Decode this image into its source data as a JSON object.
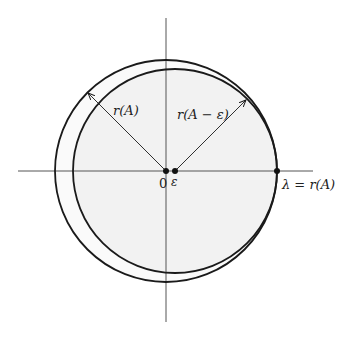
{
  "diagram": {
    "title": "",
    "labels": {
      "outer_radius": "r(A)",
      "inner_radius": "r(A − ε)",
      "origin": "0",
      "epsilon": "ε",
      "lambda": "λ = r(A)"
    },
    "elements": {
      "outer_circle": {
        "center": [
          166,
          171
        ],
        "radius": 111,
        "description": "circle of radius r(A) centered at 0"
      },
      "inner_circle": {
        "center": [
          175,
          171
        ],
        "radius": 102,
        "description": "circle of radius r(A−ε) centered at ε, shaded"
      },
      "points": [
        "0",
        "ε",
        "λ = r(A)"
      ],
      "arrows": [
        "r(A) from 0 to outer circle",
        "r(A−ε) from ε to inner circle"
      ]
    },
    "colors": {
      "stroke": "#1a1a1a",
      "fill": "#f2f2f2",
      "axis": "#555555"
    }
  }
}
